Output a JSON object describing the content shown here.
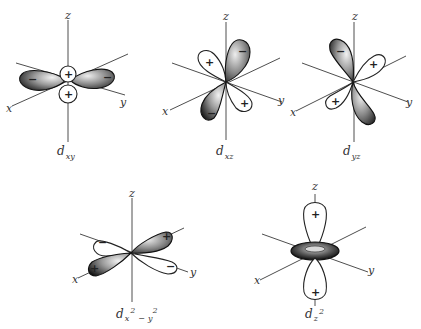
{
  "axis_labels": {
    "x": "x",
    "y": "y",
    "z": "z"
  },
  "orbitals": [
    {
      "id": "dxy",
      "label_main": "d",
      "label_sub": "xy",
      "signs": [
        "+",
        "+",
        "−",
        "−"
      ]
    },
    {
      "id": "dxz",
      "label_main": "d",
      "label_sub": "xz",
      "signs": [
        "+",
        "−",
        "−",
        "+"
      ]
    },
    {
      "id": "dyz",
      "label_main": "d",
      "label_sub": "yz",
      "signs": [
        "−",
        "+",
        "+"
      ]
    },
    {
      "id": "dx2y2",
      "label_main": "d",
      "label_sub1": "x",
      "label_sup1": "2",
      "label_minus": "−",
      "label_sub2": "y",
      "label_sup2": "2",
      "signs": [
        "−",
        "+",
        "+",
        "−"
      ]
    },
    {
      "id": "dz2",
      "label_main": "d",
      "label_sub1": "z",
      "label_sup1": "2",
      "signs": [
        "+",
        "+"
      ]
    }
  ],
  "colors": {
    "lobe_shade": "#2a2a2a",
    "line": "#333333",
    "background": "#ffffff"
  }
}
